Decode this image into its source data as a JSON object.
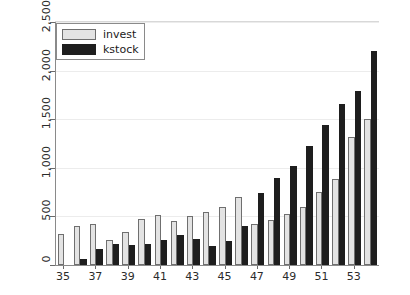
{
  "chart_data": {
    "type": "bar",
    "title": "",
    "subtitle": "",
    "xlabel": "",
    "ylabel": "",
    "grid": true,
    "legend_position": "upper left",
    "categories": [
      35,
      36,
      37,
      38,
      39,
      40,
      41,
      42,
      43,
      44,
      45,
      46,
      47,
      48,
      49,
      50,
      51,
      52,
      53,
      54
    ],
    "xtick_labels": [
      "35",
      "37",
      "39",
      "41",
      "43",
      "45",
      "47",
      "49",
      "51",
      "53"
    ],
    "xtick_values": [
      35,
      37,
      39,
      41,
      43,
      45,
      47,
      49,
      51,
      53
    ],
    "ytick_labels": [
      "0",
      "500",
      "1,000",
      "1,500",
      "2,000",
      "2,500"
    ],
    "ytick_values": [
      0,
      500,
      1000,
      1500,
      2000,
      2500
    ],
    "ylim": [
      0,
      2500
    ],
    "series": [
      {
        "name": "invest",
        "color": "#e3e3e3",
        "edge_color": "#6f6f6f",
        "values": [
          320,
          400,
          420,
          260,
          340,
          470,
          510,
          450,
          500,
          550,
          600,
          700,
          420,
          460,
          520,
          600,
          750,
          880,
          1320,
          1500
        ]
      },
      {
        "name": "kstock",
        "color": "#1e1e1e",
        "edge_color": "#1e1e1e",
        "values": [
          0,
          60,
          160,
          215,
          210,
          215,
          260,
          310,
          270,
          200,
          250,
          400,
          740,
          900,
          1020,
          1220,
          1440,
          1660,
          1790,
          2200
        ]
      }
    ]
  },
  "legend": {
    "entries": [
      {
        "label": "invest"
      },
      {
        "label": "kstock"
      }
    ]
  },
  "axes": {
    "y_axis_name": "y-axis",
    "x_axis_name": "x-axis"
  }
}
